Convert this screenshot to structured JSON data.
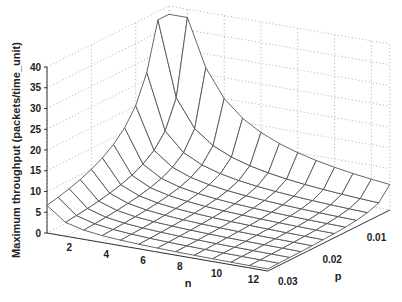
{
  "chart_data": {
    "type": "surface",
    "title": "",
    "xlabel": "n",
    "ylabel": "p",
    "zlabel": "Maximum throughput (packets/time_unit)",
    "x_ticks": [
      2,
      4,
      6,
      8,
      10,
      12
    ],
    "y_ticks": [
      0.01,
      0.02,
      0.03
    ],
    "z_ticks": [
      0,
      5,
      10,
      15,
      20,
      25,
      30,
      35,
      40
    ],
    "xlim": [
      1,
      13
    ],
    "ylim": [
      0.0025,
      0.03
    ],
    "zlim": [
      0,
      40
    ],
    "grid": true,
    "n_values": [
      1,
      2,
      3,
      4,
      5,
      6,
      7,
      8,
      9,
      10,
      11,
      12,
      13
    ],
    "p_values": [
      0.0025,
      0.005,
      0.0075,
      0.01,
      0.0125,
      0.015,
      0.0175,
      0.02,
      0.0225,
      0.025,
      0.0275,
      0.03
    ],
    "model": "z ≈ 0.2 / (n · p)",
    "z_values_n1": [
      38,
      29,
      21.5,
      18.5,
      15,
      12.5,
      11,
      10,
      9,
      8,
      7.3,
      6.7
    ],
    "peak": {
      "n": 1,
      "p": 0.0025,
      "z": 38
    }
  }
}
